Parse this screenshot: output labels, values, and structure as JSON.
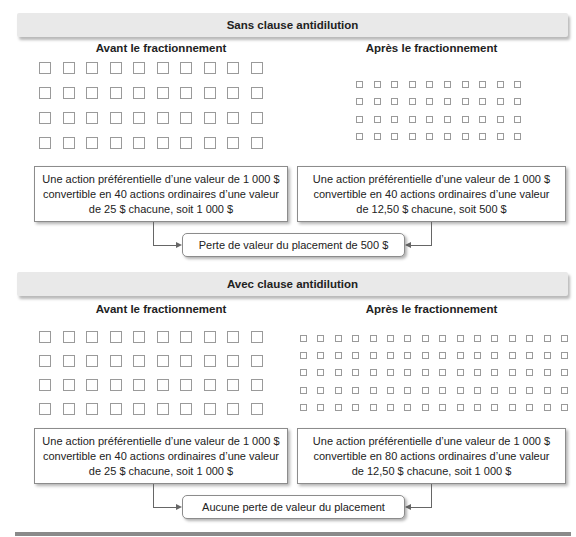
{
  "sections": [
    {
      "title": "Sans clause antidilution",
      "before": {
        "heading": "Avant le fractionnement",
        "grid": {
          "cols": 10,
          "rows": 4,
          "size": 12,
          "x0": 39,
          "y0": 62,
          "dx": 23.5,
          "dy": 25
        },
        "box_lines": [
          "Une action préférentielle d’une valeur de 1 000 $",
          "convertible en 40 actions ordinaires d’une valeur",
          "de 25 $ chacune, soit 1 000 $"
        ]
      },
      "after": {
        "heading": "Après le fractionnement",
        "grid": {
          "cols": 10,
          "rows": 4,
          "size": 7,
          "x0": 356,
          "y0": 81,
          "dx": 17.6,
          "dy": 17.3
        },
        "box_lines": [
          "Une action préférentielle d’une valeur de 1 000 $",
          "convertible en 40 actions ordinaires d’une valeur",
          "de 12,50 $ chacune, soit 500 $"
        ]
      },
      "result": "Perte de valeur du placement de 500 $"
    },
    {
      "title": "Avec clause antidilution",
      "before": {
        "heading": "Avant le fractionnement",
        "grid": {
          "cols": 10,
          "rows": 4,
          "size": 12,
          "x0": 39,
          "y0": 331,
          "dx": 23.5,
          "dy": 24
        },
        "box_lines": [
          "Une action préférentielle d’une valeur de 1 000 $",
          "convertible en 40 actions ordinaires d’une valeur",
          "de 25 $ chacune, soit 1 000 $"
        ]
      },
      "after": {
        "heading": "Après le fractionnement",
        "grid": {
          "cols": 16,
          "rows": 5,
          "size": 7,
          "x0": 300,
          "y0": 335,
          "dx": 17.4,
          "dy": 17.2
        },
        "box_lines": [
          "Une action préférentielle d’une valeur de 1 000 $",
          "convertible en 80 actions ordinaires d’une valeur",
          "de 12,50 $ chacune, soit 1 000 $"
        ]
      },
      "result": "Aucune perte de valeur du placement"
    }
  ],
  "colors": {
    "band": "#e9e9e9",
    "square_border": "#9a9a9a",
    "line": "#666666",
    "rule": "#8a8a8a"
  }
}
